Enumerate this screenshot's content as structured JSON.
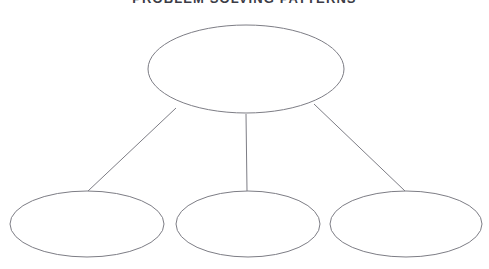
{
  "diagram": {
    "title": "PROBLEM SOLVING PATTERNS",
    "type": "concept-map",
    "background_color": "#ffffff",
    "stroke_color": "#7d7d85",
    "title_color": "#3c3c46",
    "nodes": [
      {
        "id": "parent",
        "label": "",
        "role": "parent",
        "cx": 246,
        "cy": 69,
        "rx": 98,
        "ry": 44
      },
      {
        "id": "child-left",
        "label": "",
        "role": "child",
        "cx": 87,
        "cy": 224,
        "rx": 77,
        "ry": 33
      },
      {
        "id": "child-center",
        "label": "",
        "role": "child",
        "cx": 248,
        "cy": 224,
        "rx": 72,
        "ry": 33
      },
      {
        "id": "child-right",
        "label": "",
        "role": "child",
        "cx": 406,
        "cy": 224,
        "rx": 76,
        "ry": 33
      }
    ],
    "connectors": [
      {
        "id": "connector-left",
        "from": "parent",
        "to": "child-left",
        "x1": 176,
        "y1": 108,
        "x2": 88,
        "y2": 191
      },
      {
        "id": "connector-center",
        "from": "parent",
        "to": "child-center",
        "x1": 246,
        "y1": 114,
        "x2": 247,
        "y2": 191
      },
      {
        "id": "connector-right",
        "from": "parent",
        "to": "child-right",
        "x1": 314,
        "y1": 104,
        "x2": 405,
        "y2": 191
      }
    ]
  }
}
